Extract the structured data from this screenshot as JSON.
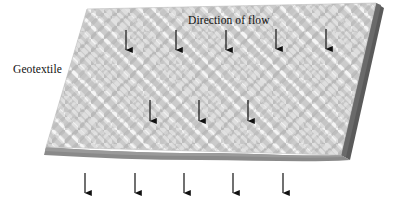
{
  "figure": {
    "labels": {
      "geotextile": "Geotextile",
      "direction_of_flow": "Direction of flow"
    },
    "colors": {
      "background": "#ffffff",
      "fabric_base": "#c9c9c9",
      "fabric_strand_light": "#f2f2f2",
      "fabric_strand_mid": "#b3b3b3",
      "edge_dark": "#5a5a5a",
      "edge_bottom": "#808080",
      "arrow": "#111111",
      "text": "#111111"
    },
    "sheet": {
      "shape": "parallelogram",
      "corner_top_left": [
        87,
        9
      ],
      "corner_top_right": [
        376,
        3
      ],
      "corner_bottom_right": [
        341,
        155
      ],
      "corner_bottom_left": [
        46,
        147
      ],
      "texture": "woven-basket-weave"
    },
    "arrows": {
      "top_row": {
        "count": 5,
        "x_positions": [
          126,
          176,
          226,
          276,
          326
        ],
        "y_start": 30,
        "y_end": 57
      },
      "middle_row": {
        "count": 3,
        "x_positions": [
          150,
          199,
          248
        ],
        "y_start": 100,
        "y_end": 128
      },
      "below_row": {
        "count": 5,
        "x_positions": [
          85,
          135,
          184,
          233,
          283
        ],
        "y_start": 173,
        "y_end": 200
      }
    }
  }
}
